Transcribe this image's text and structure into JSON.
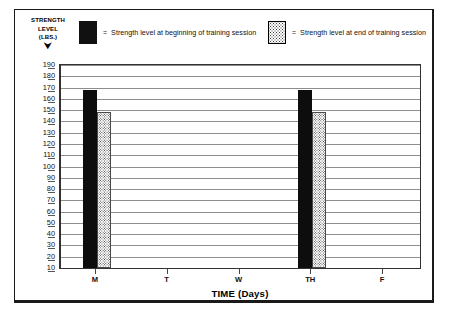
{
  "legend": {
    "axis_caption_line1": "STRENGTH",
    "axis_caption_line2": "LEVEL",
    "axis_caption_line3": "(LBS.)",
    "axis_caption_arrow": "⮟",
    "equals_sign": "=",
    "entries": [
      {
        "swatch": "solid-black-swatch",
        "label": "Strength level at beginning of training session"
      },
      {
        "swatch": "dotted-swatch",
        "label": "Strength level at end of training session"
      }
    ]
  },
  "chart_data": {
    "type": "bar",
    "title": "",
    "xlabel": "TIME (Days)",
    "ylabel": "STRENGTH LEVEL (LBS.)",
    "categories": [
      "M",
      "T",
      "W",
      "TH",
      "F"
    ],
    "ylim": [
      10,
      190
    ],
    "yticks": [
      190,
      180,
      170,
      160,
      150,
      140,
      130,
      120,
      110,
      100,
      90,
      80,
      70,
      60,
      50,
      40,
      30,
      20,
      10
    ],
    "grid": true,
    "legend_position": "top",
    "series": [
      {
        "name": "Strength level at beginning of training session",
        "fill": "solid",
        "color": "#0d0d0d",
        "values": [
          168,
          null,
          null,
          168,
          null
        ]
      },
      {
        "name": "Strength level at end of training session",
        "fill": "dotted",
        "color": "#fcfcfc",
        "values": [
          148,
          null,
          null,
          148,
          null
        ]
      }
    ]
  }
}
